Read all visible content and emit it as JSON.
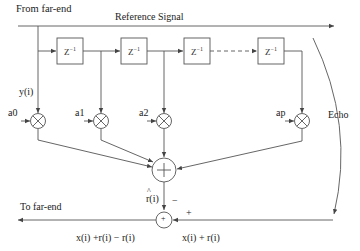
{
  "diagram": {
    "type": "adaptive echo canceller block diagram",
    "labels": {
      "from_far_end": "From far-end",
      "reference_signal": "Reference Signal",
      "input_signal": "y(i)",
      "echo": "Echo",
      "to_far_end": "To far-end",
      "estimate": "r(i)",
      "minus_sign": "−",
      "plus_sign": "+",
      "output_signal": "x(i)  +r(i) − r(i)",
      "received_signal": "x(i) + r(i)"
    },
    "delay_blocks": [
      {
        "label": "Z",
        "exp": "−1"
      },
      {
        "label": "Z",
        "exp": "−1"
      },
      {
        "label": "Z",
        "exp": "−1"
      },
      {
        "label": "Z",
        "exp": "−1"
      }
    ],
    "coefficients": [
      "a0",
      "a1",
      "a2",
      "ap"
    ],
    "adder_symbol": "+",
    "colors": {
      "stroke": "#555555",
      "text": "#222222",
      "background": "#ffffff"
    }
  }
}
